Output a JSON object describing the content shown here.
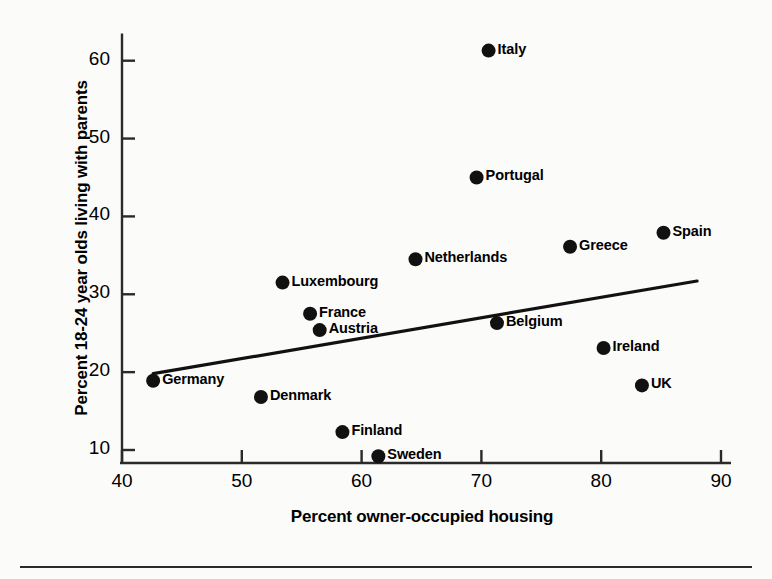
{
  "chart_data": {
    "type": "scatter",
    "title": "",
    "xlabel": "Percent owner-occupied housing",
    "ylabel": "Percent 18-24 year olds living with parents",
    "xlim": [
      40,
      90
    ],
    "ylim": [
      7,
      64
    ],
    "xticks": [
      "40",
      "50",
      "60",
      "70",
      "80",
      "90"
    ],
    "yticks": [
      "10",
      "20",
      "30",
      "40",
      "50",
      "60"
    ],
    "grid": false,
    "legend": "none",
    "points": [
      {
        "label": "Italy",
        "x": 70.6,
        "y": 61.3,
        "label_side": "right"
      },
      {
        "label": "Portugal",
        "x": 69.6,
        "y": 45.0,
        "label_side": "right"
      },
      {
        "label": "Spain",
        "x": 85.2,
        "y": 37.9,
        "label_side": "right"
      },
      {
        "label": "Greece",
        "x": 77.4,
        "y": 36.1,
        "label_side": "right"
      },
      {
        "label": "Netherlands",
        "x": 64.5,
        "y": 34.5,
        "label_side": "right"
      },
      {
        "label": "Luxembourg",
        "x": 53.4,
        "y": 31.5,
        "label_side": "right"
      },
      {
        "label": "France",
        "x": 55.7,
        "y": 27.5,
        "label_side": "right"
      },
      {
        "label": "Belgium",
        "x": 71.3,
        "y": 26.3,
        "label_side": "right"
      },
      {
        "label": "Austria",
        "x": 56.5,
        "y": 25.4,
        "label_side": "right"
      },
      {
        "label": "Ireland",
        "x": 80.2,
        "y": 23.1,
        "label_side": "right"
      },
      {
        "label": "Germany",
        "x": 42.6,
        "y": 18.9,
        "label_side": "right"
      },
      {
        "label": "UK",
        "x": 83.4,
        "y": 18.3,
        "label_side": "right"
      },
      {
        "label": "Denmark",
        "x": 51.6,
        "y": 16.8,
        "label_side": "right"
      },
      {
        "label": "Finland",
        "x": 58.4,
        "y": 12.3,
        "label_side": "right"
      },
      {
        "label": "Sweden",
        "x": 61.4,
        "y": 9.2,
        "label_side": "right"
      }
    ],
    "trend_line": {
      "x_start": 42.6,
      "y_start": 19.8,
      "x_end": 88.0,
      "y_end": 31.7,
      "style": "solid"
    },
    "marker": {
      "shape": "circle",
      "color": "#111111",
      "radius_px": 7
    },
    "axis_color": "#2a2a2a"
  }
}
